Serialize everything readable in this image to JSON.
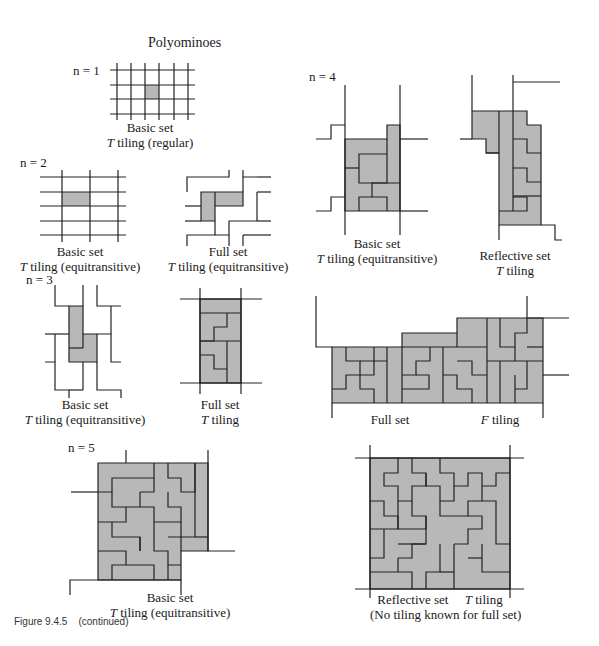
{
  "title": "Polyominoes",
  "caption": "Figure 9.4.5    (continued)",
  "colors": {
    "tile_fill": "#b8b8b8",
    "line": "#222222",
    "background": "#ffffff"
  },
  "panels": [
    {
      "id": "n1-basic",
      "n_label": "n = 1",
      "line1": "Basic set",
      "line2_italic": "T",
      "line2_rest": " tiling (regular)"
    },
    {
      "id": "n2-basic",
      "n_label": "n = 2",
      "line1": "Basic set",
      "line2_italic": "T",
      "line2_rest": " tiling (equitransitive)"
    },
    {
      "id": "n2-full",
      "line1": "Full set",
      "line2_italic": "T",
      "line2_rest": " tiling (equitransitive)"
    },
    {
      "id": "n3-basic",
      "n_label": "n = 3",
      "line1": "Basic set",
      "line2_italic": "T",
      "line2_rest": " tiling (equitransitive)"
    },
    {
      "id": "n3-full",
      "line1": "Full set",
      "line2_italic": "T",
      "line2_rest": " tiling"
    },
    {
      "id": "n4-basic",
      "n_label": "n = 4",
      "line1": "Basic set",
      "line2_italic": "T",
      "line2_rest": " tiling (equitransitive)"
    },
    {
      "id": "n4-reflective",
      "line1": "Reflective set",
      "line2_italic": "T",
      "line2_rest": " tiling"
    },
    {
      "id": "n4-full",
      "line1": "Full set",
      "line2_italic": "F",
      "line2_rest": " tiling"
    },
    {
      "id": "n5-basic",
      "n_label": "n = 5",
      "line1": "Basic set",
      "line2_italic": "T",
      "line2_rest": " tiling (equitransitive)"
    },
    {
      "id": "n5-reflective",
      "line1": "Reflective set",
      "line2_italic": "T",
      "line2_rest": " tiling",
      "line3": "(No tiling known for full set)"
    }
  ]
}
